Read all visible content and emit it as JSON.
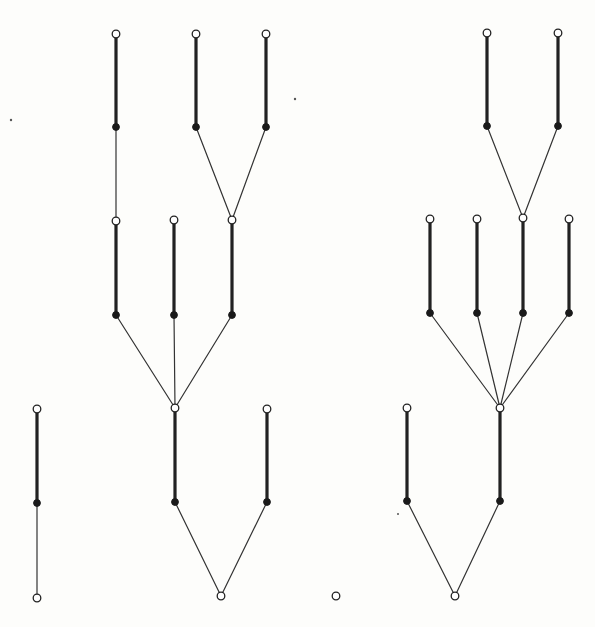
{
  "diagram": {
    "title": "",
    "colors": {
      "background": "#fdfdfb",
      "edge": "#222222",
      "node_fill_open": "#ffffff",
      "node_fill_filled": "#1a1a1a"
    },
    "node_types": [
      "open",
      "filled"
    ],
    "edge_types": [
      "thick",
      "thin"
    ],
    "components": [
      {
        "id": "left-tree",
        "nodes": [
          {
            "id": "L1",
            "type": "open"
          },
          {
            "id": "L2",
            "type": "filled"
          },
          {
            "id": "L3",
            "type": "open"
          },
          {
            "id": "L4",
            "type": "filled"
          },
          {
            "id": "L5",
            "type": "open"
          },
          {
            "id": "L6",
            "type": "filled"
          },
          {
            "id": "L7",
            "type": "open"
          },
          {
            "id": "L8",
            "type": "filled"
          },
          {
            "id": "L9",
            "type": "open"
          },
          {
            "id": "L10",
            "type": "filled"
          },
          {
            "id": "L11",
            "type": "open"
          },
          {
            "id": "L12",
            "type": "filled"
          },
          {
            "id": "L13",
            "type": "open"
          },
          {
            "id": "L14",
            "type": "filled"
          },
          {
            "id": "L15",
            "type": "open"
          },
          {
            "id": "L16",
            "type": "filled"
          },
          {
            "id": "L17",
            "type": "open"
          }
        ],
        "edges": [
          {
            "from": "L1",
            "to": "L2",
            "type": "thick"
          },
          {
            "from": "L2",
            "to": "L5",
            "type": "thin"
          },
          {
            "from": "L3",
            "to": "L4",
            "type": "thick"
          },
          {
            "from": "L4",
            "to": "L9",
            "type": "thin"
          },
          {
            "from": "L6",
            "to": "L9",
            "type": "thin"
          },
          {
            "from": "L5",
            "to": "L6",
            "type": "thick"
          },
          {
            "from": "L7",
            "to": "L8",
            "type": "thick"
          },
          {
            "from": "L8",
            "to": "L11",
            "type": "thin"
          },
          {
            "from": "L9",
            "to": "L10",
            "type": "thick"
          },
          {
            "from": "L10",
            "to": "L13",
            "type": "thin"
          },
          {
            "from": "L11",
            "to": "L12",
            "type": "thick"
          },
          {
            "from": "L12",
            "to": "L13",
            "type": "thin"
          },
          {
            "from": "L13",
            "to": "L14",
            "type": "thick"
          },
          {
            "from": "L14",
            "to": "L17",
            "type": "thin"
          },
          {
            "from": "L15",
            "to": "L16",
            "type": "thick"
          },
          {
            "from": "L16",
            "to": "L17",
            "type": "thin"
          }
        ]
      },
      {
        "id": "isolated-path",
        "nodes": [
          {
            "id": "P1",
            "type": "open"
          },
          {
            "id": "P2",
            "type": "filled"
          },
          {
            "id": "P3",
            "type": "open"
          }
        ],
        "edges": [
          {
            "from": "P1",
            "to": "P2",
            "type": "thick"
          },
          {
            "from": "P2",
            "to": "P3",
            "type": "thin"
          }
        ]
      },
      {
        "id": "isolated-vertex",
        "nodes": [
          {
            "id": "I1",
            "type": "open"
          }
        ],
        "edges": []
      },
      {
        "id": "right-tree",
        "nodes": [
          {
            "id": "R1",
            "type": "open"
          },
          {
            "id": "R2",
            "type": "filled"
          },
          {
            "id": "R3",
            "type": "open"
          },
          {
            "id": "R4",
            "type": "filled"
          },
          {
            "id": "R5",
            "type": "open"
          },
          {
            "id": "R6",
            "type": "filled"
          },
          {
            "id": "R7",
            "type": "open"
          },
          {
            "id": "R8",
            "type": "filled"
          },
          {
            "id": "R9",
            "type": "open"
          },
          {
            "id": "R10",
            "type": "filled"
          },
          {
            "id": "R11",
            "type": "open"
          },
          {
            "id": "R12",
            "type": "filled"
          },
          {
            "id": "R13",
            "type": "open"
          },
          {
            "id": "R14",
            "type": "filled"
          },
          {
            "id": "R15",
            "type": "open"
          },
          {
            "id": "R16",
            "type": "filled"
          },
          {
            "id": "R17",
            "type": "open"
          }
        ],
        "edges": [
          {
            "from": "R1",
            "to": "R2",
            "type": "thick"
          },
          {
            "from": "R3",
            "to": "R4",
            "type": "thick"
          },
          {
            "from": "R2",
            "to": "R9",
            "type": "thin"
          },
          {
            "from": "R4",
            "to": "R9",
            "type": "thin"
          },
          {
            "from": "R5",
            "to": "R6",
            "type": "thick"
          },
          {
            "from": "R7",
            "to": "R8",
            "type": "thick"
          },
          {
            "from": "R9",
            "to": "R10",
            "type": "thick"
          },
          {
            "from": "R11",
            "to": "R12",
            "type": "thick"
          },
          {
            "from": "R6",
            "to": "R13",
            "type": "thin"
          },
          {
            "from": "R8",
            "to": "R13",
            "type": "thin"
          },
          {
            "from": "R10",
            "to": "R13",
            "type": "thin"
          },
          {
            "from": "R12",
            "to": "R13",
            "type": "thin"
          },
          {
            "from": "R13",
            "to": "R14",
            "type": "thick"
          },
          {
            "from": "R15",
            "to": "R16",
            "type": "thick"
          },
          {
            "from": "R14",
            "to": "R17",
            "type": "thin"
          },
          {
            "from": "R16",
            "to": "R17",
            "type": "thin"
          }
        ]
      }
    ]
  }
}
